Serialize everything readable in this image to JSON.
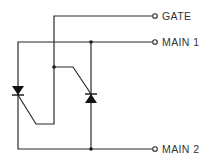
{
  "diagram": {
    "type": "circuit-schematic",
    "component": "triac-equivalent (two SCRs antiparallel)",
    "terminals": [
      {
        "id": "gate",
        "label": "GATE"
      },
      {
        "id": "main1",
        "label": "MAIN 1"
      },
      {
        "id": "main2",
        "label": "MAIN 2"
      }
    ],
    "colors": {
      "line": "#2a2a2a",
      "background": "#ffffff"
    }
  }
}
